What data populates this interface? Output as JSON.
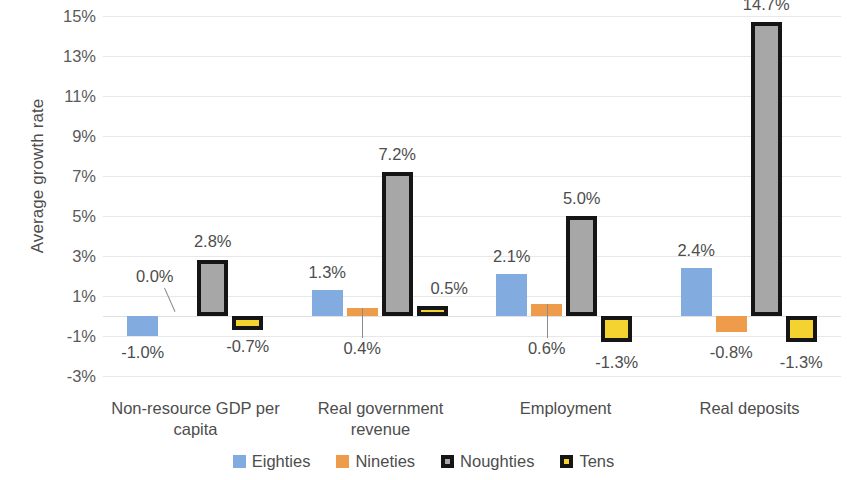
{
  "chart_data": {
    "type": "bar",
    "title": "",
    "xlabel": "",
    "ylabel": "Average growth rate",
    "ylim": [
      -3,
      15
    ],
    "ytick_step": 2,
    "grid": true,
    "legend_position": "bottom",
    "categories": [
      "Non-resource GDP per capita",
      "Real government revenue",
      "Employment",
      "Real deposits"
    ],
    "series": [
      {
        "name": "Eighties",
        "color": "#82ACE0",
        "values": [
          -1.0,
          1.3,
          2.1,
          2.4
        ],
        "labels": [
          "-1.0%",
          "1.3%",
          "2.1%",
          "2.4%"
        ]
      },
      {
        "name": "Nineties",
        "color": "#EE9B4C",
        "values": [
          0.0,
          0.4,
          0.6,
          -0.8
        ],
        "labels": [
          "0.0%",
          "0.4%",
          "0.6%",
          "-0.8%"
        ]
      },
      {
        "name": "Noughties",
        "color": "#A7A7A7",
        "values": [
          2.8,
          7.2,
          5.0,
          14.7
        ],
        "labels": [
          "2.8%",
          "7.2%",
          "5.0%",
          "14.7%"
        ]
      },
      {
        "name": "Tens",
        "color": "#F4D330",
        "values": [
          -0.7,
          0.5,
          -1.3,
          -1.3
        ],
        "labels": [
          "-0.7%",
          "0.5%",
          "-1.3%",
          "-1.3%"
        ]
      }
    ],
    "ytick_labels": [
      "15%",
      "13%",
      "11%",
      "9%",
      "7%",
      "5%",
      "3%",
      "1%",
      "-1%",
      "-3%"
    ],
    "ytick_values": [
      15,
      13,
      11,
      9,
      7,
      5,
      3,
      1,
      -1,
      -3
    ]
  },
  "axis": {
    "y_title": "Average growth rate"
  },
  "categories": {
    "c0_line1": "Non-resource GDP per",
    "c0_line2": "capita",
    "c1_line1": "Real government",
    "c1_line2": "revenue",
    "c2_line1": "Employment",
    "c2_line2": "",
    "c3_line1": "Real deposits",
    "c3_line2": ""
  },
  "legend": {
    "items": [
      {
        "label": "Eighties"
      },
      {
        "label": "Nineties"
      },
      {
        "label": "Noughties"
      },
      {
        "label": "Tens"
      }
    ]
  }
}
